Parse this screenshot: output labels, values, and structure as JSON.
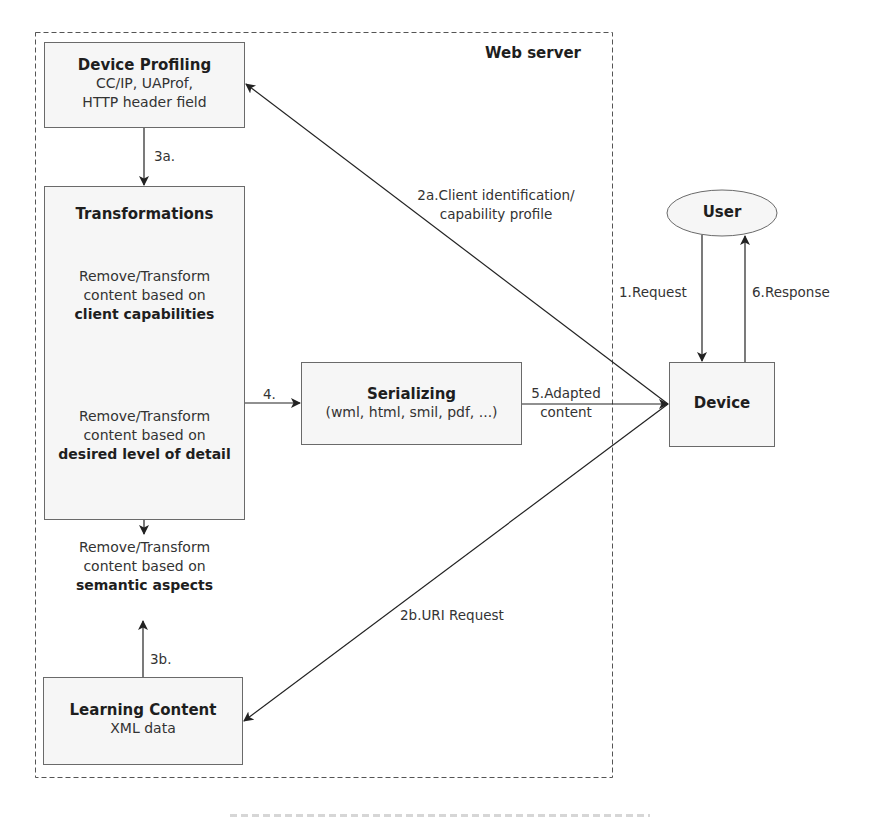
{
  "diagram": {
    "container": {
      "label": "Web server",
      "style": "dashed"
    },
    "nodes": {
      "device_profiling": {
        "title": "Device Profiling",
        "lines": [
          "CC/IP, UAProf,",
          "HTTP header field"
        ]
      },
      "transformations": {
        "title": "Transformations",
        "steps": [
          {
            "line1": "Remove/Transform",
            "line2": "content based on",
            "emphasis": "client capabilities"
          },
          {
            "line1": "Remove/Transform",
            "line2": "content based on",
            "emphasis": "desired level of detail"
          },
          {
            "line1": "Remove/Transform",
            "line2": "content based on",
            "emphasis": "semantic aspects"
          }
        ]
      },
      "serializing": {
        "title": "Serializing",
        "formats": "(wml, html, smil, pdf, ...)"
      },
      "learning_content": {
        "title": "Learning Content",
        "subtitle": "XML data"
      },
      "user": {
        "title": "User",
        "shape": "ellipse"
      },
      "device": {
        "title": "Device"
      }
    },
    "edges": [
      {
        "id": "1",
        "from": "user",
        "to": "device",
        "label": "1.Request"
      },
      {
        "id": "2a",
        "from": "device",
        "to": "device_profiling",
        "label_line1": "2a.Client identification/",
        "label_line2": "capability profile"
      },
      {
        "id": "2b",
        "from": "device",
        "to": "learning_content",
        "label": "2b.URI Request"
      },
      {
        "id": "3a",
        "from": "device_profiling",
        "to": "transformations",
        "label": "3a."
      },
      {
        "id": "3b",
        "from": "learning_content",
        "to": "transformations",
        "label": "3b."
      },
      {
        "id": "4",
        "from": "transformations",
        "to": "serializing",
        "label": "4."
      },
      {
        "id": "5",
        "from": "serializing",
        "to": "device",
        "label_line1": "5.Adapted",
        "label_line2": "content"
      },
      {
        "id": "6",
        "from": "device",
        "to": "user",
        "label": "6.Response"
      }
    ]
  },
  "colors": {
    "box_fill": "#f6f6f6",
    "box_border": "#6a6a6a",
    "line": "#2a2a2a",
    "text": "#222222"
  }
}
